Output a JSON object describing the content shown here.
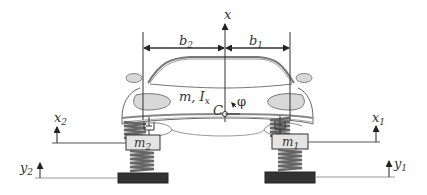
{
  "diagram": {
    "colors": {
      "line": "#555555",
      "body_fill": "#ffffff",
      "light_fill": "#d8d8d8",
      "spring": "#666666",
      "mass_fill": "#e4e4e4",
      "ground_fill": "#333333"
    },
    "labels": {
      "x": {
        "base": "x",
        "sub": ""
      },
      "b2": {
        "base": "b",
        "sub": "2"
      },
      "b1": {
        "base": "b",
        "sub": "1"
      },
      "mass_inertia": {
        "base": "m, I",
        "sub": "x"
      },
      "center": {
        "base": "C",
        "sub": ""
      },
      "phi": {
        "base": "φ",
        "sub": ""
      },
      "m2": {
        "base": "m",
        "sub": "2"
      },
      "m1": {
        "base": "m",
        "sub": "1"
      },
      "x2": {
        "base": "x",
        "sub": "2"
      },
      "x1": {
        "base": "x",
        "sub": "1"
      },
      "y2": {
        "base": "y",
        "sub": "2"
      },
      "y1": {
        "base": "y",
        "sub": "1"
      }
    },
    "components": [
      {
        "name": "car-body",
        "desc": "sprung mass m with moment of inertia I_x about center C"
      },
      {
        "name": "left-suspension",
        "desc": "spring and damper connecting body to unsprung mass m2"
      },
      {
        "name": "right-suspension",
        "desc": "spring and damper connecting body to unsprung mass m1"
      },
      {
        "name": "left-tire-spring",
        "desc": "tire stiffness spring between m2 and ground input y2"
      },
      {
        "name": "right-tire-spring",
        "desc": "tire stiffness spring between m1 and ground input y1"
      }
    ]
  }
}
